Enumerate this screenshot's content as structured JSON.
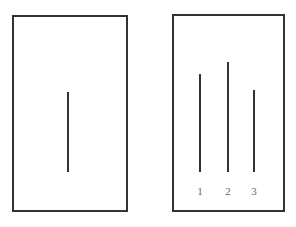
{
  "figure": {
    "background_color": "#ffffff",
    "stroke_color": "#333333",
    "label_color": "#666666",
    "width": 296,
    "height": 227
  },
  "panels": [
    {
      "id": "standard-panel",
      "name": "standard-stimulus-panel",
      "x": 12,
      "y": 15,
      "width": 116,
      "height": 197,
      "border_width": 2,
      "border_color": "#333333"
    },
    {
      "id": "comparison-panel",
      "name": "comparison-stimulus-panel",
      "x": 172,
      "y": 14,
      "width": 113,
      "height": 198,
      "border_width": 2,
      "border_color": "#333333"
    }
  ],
  "standard_line": {
    "label": "",
    "x": 68,
    "top": 92,
    "bottom": 172,
    "length": 80,
    "thickness": 2,
    "color": "#333333"
  },
  "comparison_lines": [
    {
      "label": "1",
      "x": 200,
      "top": 74,
      "bottom": 172,
      "length": 98,
      "thickness": 2,
      "color": "#333333",
      "label_x": 200,
      "label_y": 186
    },
    {
      "label": "2",
      "x": 228,
      "top": 62,
      "bottom": 172,
      "length": 110,
      "thickness": 2,
      "color": "#333333",
      "label_x": 228,
      "label_y": 186
    },
    {
      "label": "3",
      "x": 254,
      "top": 90,
      "bottom": 172,
      "length": 82,
      "thickness": 2,
      "color": "#333333",
      "label_x": 254,
      "label_y": 186
    }
  ],
  "label_font_size": 11,
  "chart_data": {
    "type": "bar",
    "title": "",
    "xlabel": "",
    "ylabel": "",
    "orientation": "vertical",
    "baseline_y": 172,
    "categories": [
      "standard",
      "1",
      "2",
      "3"
    ],
    "values": [
      80,
      98,
      110,
      82
    ],
    "series": [
      {
        "name": "line-length-px",
        "values": [
          80,
          98,
          110,
          82
        ]
      }
    ],
    "grid": false,
    "legend": "none"
  }
}
